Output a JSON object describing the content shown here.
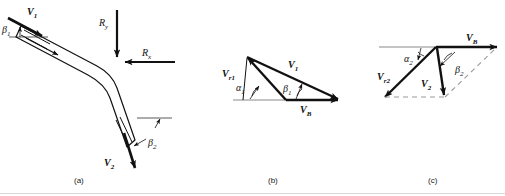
{
  "figure": {
    "type": "technical-diagram",
    "panels": [
      {
        "id": "a",
        "caption": "(a)",
        "description": "Curved vane with inlet and outlet absolute velocities and reaction force components",
        "labels": [
          {
            "name": "V1",
            "base": "V",
            "subscript": "1",
            "role": "inlet-absolute-velocity"
          },
          {
            "name": "beta1",
            "base": "β",
            "subscript": "1",
            "role": "inlet-blade-angle"
          },
          {
            "name": "Ry",
            "base": "R",
            "subscript": "y",
            "role": "vertical-reaction-force"
          },
          {
            "name": "Rx",
            "base": "R",
            "subscript": "x",
            "role": "horizontal-reaction-force"
          },
          {
            "name": "beta2",
            "base": "β",
            "subscript": "2",
            "role": "outlet-blade-angle"
          },
          {
            "name": "V2",
            "base": "V",
            "subscript": "2",
            "role": "outlet-absolute-velocity"
          }
        ]
      },
      {
        "id": "b",
        "caption": "(b)",
        "description": "Inlet velocity triangle",
        "labels": [
          {
            "name": "Vr1",
            "base": "V",
            "subscript": "r1",
            "role": "inlet-relative-velocity"
          },
          {
            "name": "V1",
            "base": "V",
            "subscript": "1",
            "role": "inlet-absolute-velocity"
          },
          {
            "name": "alpha1",
            "base": "α",
            "subscript": "1",
            "role": "inlet-relative-flow-angle"
          },
          {
            "name": "beta1",
            "base": "β",
            "subscript": "1",
            "role": "inlet-absolute-flow-angle"
          },
          {
            "name": "VB",
            "base": "V",
            "subscript": "B",
            "role": "blade-velocity"
          }
        ]
      },
      {
        "id": "c",
        "caption": "(c)",
        "description": "Outlet velocity triangle",
        "labels": [
          {
            "name": "alpha2",
            "base": "α",
            "subscript": "2",
            "role": "outlet-relative-flow-angle"
          },
          {
            "name": "VB",
            "base": "V",
            "subscript": "B",
            "role": "blade-velocity"
          },
          {
            "name": "Vr2",
            "base": "V",
            "subscript": "r2",
            "role": "outlet-relative-velocity"
          },
          {
            "name": "V2",
            "base": "V",
            "subscript": "2",
            "role": "outlet-absolute-velocity"
          },
          {
            "name": "beta2",
            "base": "β",
            "subscript": "2",
            "role": "outlet-absolute-flow-angle"
          }
        ]
      }
    ],
    "colors": {
      "ink": "#111111",
      "reference_line": "#8a8a8a",
      "dashed_line": "#9a9a9a",
      "bottom_rule": "#d8d8d8",
      "background": "#ffffff"
    }
  },
  "panel_a": {
    "caption": "(a)",
    "V1": {
      "base": "V",
      "sub": "1"
    },
    "beta1": {
      "base": "β",
      "sub": "1"
    },
    "Ry": {
      "base": "R",
      "sub": "y"
    },
    "Rx": {
      "base": "R",
      "sub": "x"
    },
    "beta2": {
      "base": "β",
      "sub": "2"
    },
    "V2": {
      "base": "V",
      "sub": "2"
    }
  },
  "panel_b": {
    "caption": "(b)",
    "Vr1": {
      "base": "V",
      "sub": "r1"
    },
    "V1": {
      "base": "V",
      "sub": "1"
    },
    "alpha1": {
      "base": "α",
      "sub": "1"
    },
    "beta1": {
      "base": "β",
      "sub": "1"
    },
    "VB": {
      "base": "V",
      "sub": "B"
    }
  },
  "panel_c": {
    "caption": "(c)",
    "alpha2": {
      "base": "α",
      "sub": "2"
    },
    "VB": {
      "base": "V",
      "sub": "B"
    },
    "Vr2": {
      "base": "V",
      "sub": "r2"
    },
    "V2": {
      "base": "V",
      "sub": "2"
    },
    "beta2": {
      "base": "β",
      "sub": "2"
    }
  }
}
